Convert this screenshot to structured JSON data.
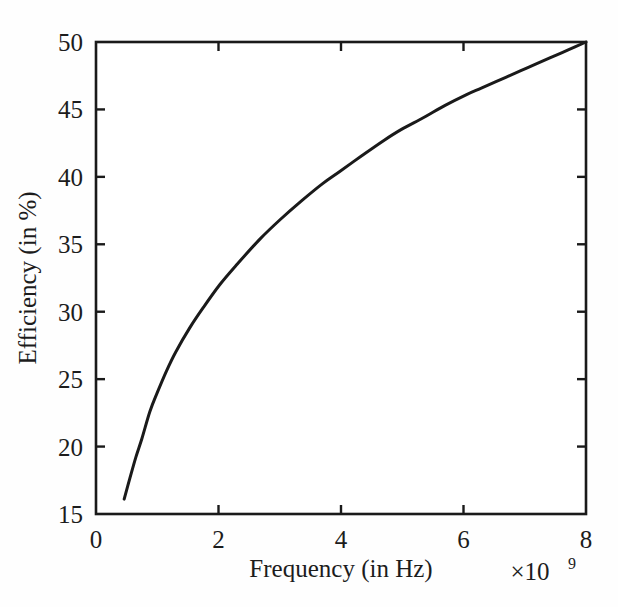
{
  "chart_data": {
    "type": "line",
    "title": "",
    "xlabel": "Frequency (in Hz)",
    "ylabel": "Efficiency (in %)",
    "x_exponent_label": "×10",
    "x_exponent_power": "9",
    "xlim": [
      0,
      8
    ],
    "ylim": [
      15,
      50
    ],
    "x_scale_factor": 1000000000,
    "xticks": [
      0,
      2,
      4,
      6,
      8
    ],
    "xtick_labels": [
      "0",
      "2",
      "4",
      "6",
      "8"
    ],
    "yticks": [
      15,
      20,
      25,
      30,
      35,
      40,
      45,
      50
    ],
    "ytick_labels": [
      "15",
      "20",
      "25",
      "30",
      "35",
      "40",
      "45",
      "50"
    ],
    "grid": false,
    "legend": false,
    "legend_position": "none",
    "line_color": "#1a1a1a",
    "line_width_px": 3,
    "background_color": "#fefefe",
    "axis_color": "#1a1a1a",
    "tick_direction": "in",
    "series": [
      {
        "name": "Efficiency vs Frequency",
        "x": [
          0.46,
          0.55,
          0.65,
          0.75,
          0.88,
          1.0,
          1.15,
          1.3,
          1.53,
          1.75,
          2.02,
          2.3,
          2.68,
          3.0,
          3.35,
          3.7,
          3.98,
          4.35,
          4.7,
          4.98,
          5.35,
          5.7,
          6.05,
          6.3,
          6.7,
          7.05,
          7.4,
          7.7,
          8.0
        ],
        "y": [
          16.1,
          17.6,
          19.2,
          20.6,
          22.6,
          24.0,
          25.6,
          27.0,
          28.8,
          30.3,
          32.0,
          33.5,
          35.4,
          36.8,
          38.2,
          39.5,
          40.4,
          41.6,
          42.7,
          43.5,
          44.4,
          45.3,
          46.1,
          46.6,
          47.4,
          48.1,
          48.8,
          49.4,
          50.0
        ]
      }
    ]
  },
  "plot_box": {
    "left_px": 96,
    "right_px": 586,
    "top_px": 42,
    "bottom_px": 514
  }
}
